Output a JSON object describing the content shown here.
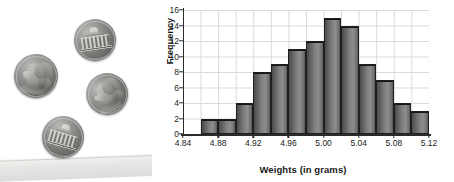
{
  "figure": {
    "photo": {
      "subject": "four-us-nickel-coins",
      "coins": [
        {
          "name": "coin-nickel-obverse-left",
          "face": "jefferson-profile"
        },
        {
          "name": "coin-nickel-reverse-top",
          "face": "monticello-building"
        },
        {
          "name": "coin-nickel-obverse-right",
          "face": "jefferson-profile"
        },
        {
          "name": "coin-nickel-reverse-bottom",
          "face": "monticello-building"
        }
      ]
    }
  },
  "chart_data": {
    "type": "bar",
    "subtype": "histogram",
    "title": "",
    "xlabel": "Weights (in grams)",
    "ylabel": "Frequency",
    "xlim": [
      4.84,
      5.12
    ],
    "ylim": [
      0,
      16
    ],
    "grid": true,
    "legend": null,
    "xticks": [
      "4.84",
      "4.88",
      "4.92",
      "4.96",
      "5.00",
      "5.04",
      "5.08",
      "5.12"
    ],
    "xtick_values": [
      4.84,
      4.88,
      4.92,
      4.96,
      5.0,
      5.04,
      5.08,
      5.12
    ],
    "yticks": [
      "0",
      "2",
      "4",
      "6",
      "8",
      "10",
      "12",
      "14",
      "16"
    ],
    "ytick_values": [
      0,
      2,
      4,
      6,
      8,
      10,
      12,
      14,
      16
    ],
    "bin_width": 0.02,
    "bin_starts": [
      4.86,
      4.88,
      4.9,
      4.92,
      4.94,
      4.96,
      4.98,
      5.0,
      5.02,
      5.04,
      5.06,
      5.08,
      5.1
    ],
    "categories": [
      "4.86-4.88",
      "4.88-4.90",
      "4.90-4.92",
      "4.92-4.94",
      "4.94-4.96",
      "4.96-4.98",
      "4.98-5.00",
      "5.00-5.02",
      "5.02-5.04",
      "5.04-5.06",
      "5.06-5.08",
      "5.08-5.10",
      "5.10-5.12"
    ],
    "values": [
      2,
      2,
      4,
      8,
      9,
      11,
      12,
      15,
      14,
      9,
      7,
      4,
      3
    ],
    "colors": {
      "bar_fill": "#7e7e7e",
      "bar_edge": "#1f1f1f",
      "grid": "#d9d9d9",
      "axis": "#2b2b2b",
      "text": "#1a1a1a",
      "background": "#ffffff"
    }
  }
}
